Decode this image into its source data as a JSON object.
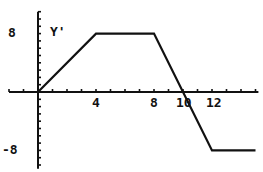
{
  "chart_data": {
    "type": "line",
    "title": "",
    "series": [
      {
        "name": "Y'",
        "x": [
          0,
          4,
          8,
          12,
          15
        ],
        "y": [
          0,
          8,
          8,
          -8,
          -8
        ]
      }
    ],
    "xlabel": "",
    "ylabel": "Y'",
    "x_tick_labels": [
      "4",
      "8",
      "10",
      "12"
    ],
    "y_tick_labels": [
      "8",
      "-8"
    ],
    "xlim": [
      -2,
      15.2
    ],
    "ylim": [
      -10.5,
      11
    ],
    "x_tick_step": 1,
    "y_tick_step": 1,
    "grid": false,
    "legend": "none"
  },
  "labels": {
    "function_name": "Y'",
    "y_top": "8",
    "y_bottom": "-8",
    "x4": "4",
    "x8": "8",
    "x10": "10",
    "x12": "12"
  },
  "colors": {
    "axis": "#111111",
    "curve": "#111111",
    "background": "#ffffff"
  }
}
